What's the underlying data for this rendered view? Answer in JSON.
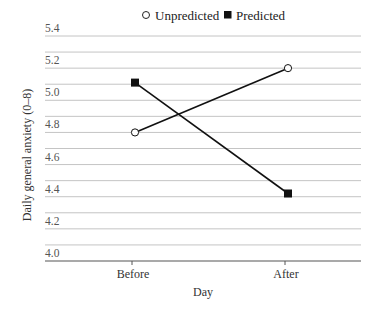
{
  "chart_data": {
    "type": "line",
    "title": "",
    "xlabel": "Day",
    "ylabel": "Daily general anxiety (0–8)",
    "categories": [
      "Before",
      "After"
    ],
    "series": [
      {
        "name": "Unpredicted",
        "marker": "open-circle",
        "values": [
          4.8,
          5.2
        ]
      },
      {
        "name": "Predicted",
        "marker": "filled-square",
        "values": [
          5.11,
          4.42
        ]
      }
    ],
    "ylim": [
      4.0,
      5.4
    ],
    "yticks": [
      "4.0",
      "4.2",
      "4.4",
      "4.6",
      "4.8",
      "5.0",
      "5.2",
      "5.4"
    ],
    "grid_step": 0.1,
    "grid": true,
    "legend_position": "top-center",
    "colors": {
      "line": "#111111",
      "grid": "#c4c4c4",
      "axis": "#555555"
    }
  },
  "legend": {
    "items": [
      {
        "label": "Unpredicted",
        "icon": "open-circle-icon"
      },
      {
        "label": "Predicted",
        "icon": "filled-square-icon"
      }
    ]
  }
}
